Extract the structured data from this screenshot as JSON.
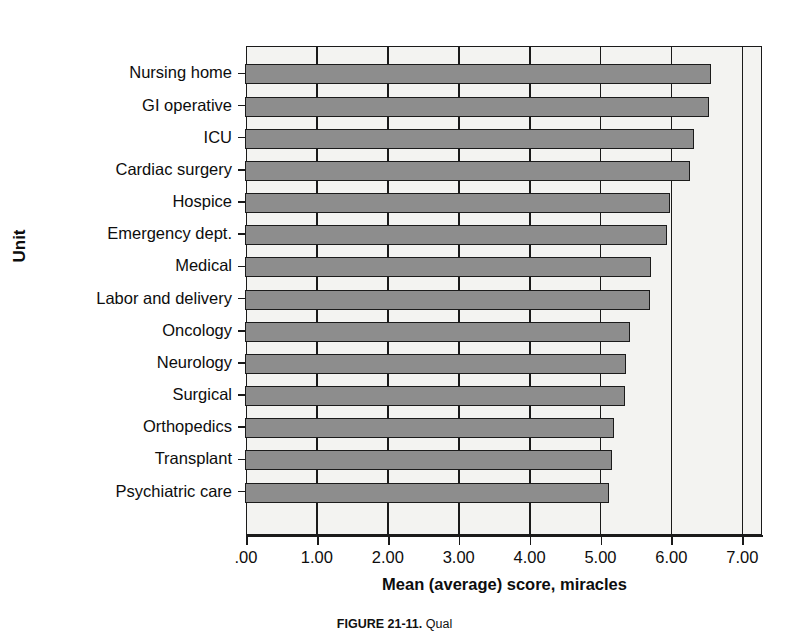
{
  "chart_data": {
    "type": "bar",
    "orientation": "horizontal",
    "title": "",
    "xlabel": "Mean (average) score, miracles",
    "ylabel": "Unit",
    "xlim": [
      0,
      7.3
    ],
    "xticks": [
      0,
      1,
      2,
      3,
      4,
      5,
      6,
      7
    ],
    "xticklabels": [
      ".00",
      "1.00",
      "2.00",
      "3.00",
      "4.00",
      "5.00",
      "6.00",
      "7.00"
    ],
    "grid": true,
    "legend": null,
    "categories": [
      "Nursing home",
      "GI operative",
      "ICU",
      "Cardiac surgery",
      "Hospice",
      "Emergency dept.",
      "Medical",
      "Labor and delivery",
      "Oncology",
      "Neurology",
      "Surgical",
      "Orthopedics",
      "Transplant",
      "Psychiatric care"
    ],
    "values": [
      6.55,
      6.52,
      6.3,
      6.25,
      5.97,
      5.92,
      5.7,
      5.68,
      5.4,
      5.35,
      5.33,
      5.18,
      5.15,
      5.1
    ],
    "bar_color": "#8d8d8d",
    "bar_edge_color": "#1b1b1b",
    "plot_background": "#f3f3f1"
  },
  "caption": {
    "label": "FIGURE 21-11.",
    "text": " Qual"
  }
}
